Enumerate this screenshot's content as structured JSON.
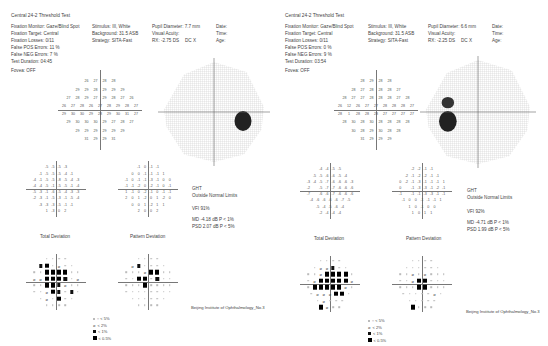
{
  "reports": [
    {
      "title": "Central 24-2 Threshold Test",
      "fixation_monitor": "Fixation Monitor: Gaze/Blind Spot",
      "fixation_target": "Fixation Target: Central",
      "fixation_losses": "Fixation Losses: 0/11",
      "false_pos": "False POS Errors:  11 %",
      "false_neg": "False NEG Errors:  7 %",
      "test_duration": "Test Duration: 04:45",
      "fovea": "Fovea: OFF",
      "stimulus": "Stimulus: III, White",
      "background": "Background: 31.5 ASB",
      "strategy": "Strategy: SITA-Fast",
      "pupil": "Pupil Diameter: 7.7 mm",
      "visual_acuity": "Visual Acuity:",
      "rx": "RX: -2.75 DS",
      "dc": "DC X",
      "date": "Date:",
      "time": "Time:",
      "age": "Age:",
      "ght_label": "GHT",
      "ght_value": "Outside Normal Limits",
      "vfi": "VFI   91%",
      "md": "MD    -4.18 dB  P < 1%",
      "psd": "PSD   2.07 dB  P < 5%",
      "total_deviation_label": "Total Deviation",
      "pattern_deviation_label": "Pattern Deviation",
      "institution": "Beijing Institute of Ophthalmology_No.3",
      "axis_label": "30",
      "threshold_rows": [
        [
          "26",
          "27",
          "28",
          "28"
        ],
        [
          "29",
          "29",
          "28",
          "29",
          "29",
          "29"
        ],
        [
          "27",
          "28",
          "29",
          "27",
          "29",
          "28",
          "27",
          "26"
        ],
        [
          "26",
          "27",
          "28",
          "26",
          "27",
          "28",
          "29",
          "28",
          "27"
        ],
        [
          "29",
          "30",
          "30",
          "29",
          "28",
          "29",
          "30",
          "31",
          "27"
        ],
        [
          "29",
          "30",
          "30",
          "30",
          "29",
          "27",
          "28",
          "27"
        ],
        [
          "29",
          "29",
          "29",
          "29",
          "29",
          "29"
        ],
        [
          "31",
          "29",
          "29",
          "31"
        ]
      ],
      "total_dev_rows": [
        [
          "-5",
          "-5",
          "-5",
          "-3"
        ],
        [
          "-1",
          "-5",
          "-5",
          "-5",
          "-4",
          "-1"
        ],
        [
          "-4",
          "-1",
          "-5",
          "-5",
          "-8",
          "-5",
          "-4",
          "-3"
        ],
        [
          "-4",
          "-4",
          "-5",
          "-1",
          "-5",
          "-5",
          "-1",
          "-4"
        ],
        [
          "-5",
          "-3",
          "-1",
          "-6",
          "-5",
          "-4",
          "-3",
          "-3"
        ],
        [
          "-2",
          "-3",
          "-1",
          "-5",
          "-3",
          "-1",
          "-5",
          "-4"
        ],
        [
          "-3",
          "-3",
          "-3",
          "-5",
          "-1",
          "-1"
        ],
        [
          "1",
          "-3",
          "0",
          "2"
        ]
      ],
      "pattern_dev_rows": [
        [
          "-1",
          "0",
          "-1",
          "-1"
        ],
        [
          "0",
          "0",
          "-1",
          "-1",
          "-1",
          "1"
        ],
        [
          "-1",
          "0",
          "-1",
          "-1",
          "-3",
          "-1",
          "0",
          "0"
        ],
        [
          "-1",
          "-1",
          "-2",
          "0",
          "-2",
          "-1",
          "0",
          "-1"
        ],
        [
          "1",
          "-1",
          "0",
          "-2",
          "-1",
          "0",
          "-1",
          "-1"
        ],
        [
          "2",
          "0",
          "1",
          "-2",
          "0",
          "1",
          "-2",
          "0"
        ],
        [
          "0",
          "0",
          "1",
          "-2",
          "1",
          "1"
        ],
        [
          "2",
          "0",
          "0",
          "2"
        ]
      ],
      "total_prob_rows": [
        [
          ".",
          ".",
          ".",
          "."
        ],
        [
          "s1",
          "s05",
          ".",
          "s2",
          ".",
          "."
        ],
        [
          ".",
          ".",
          "s05",
          "s05",
          "s05",
          "s05",
          ".",
          "."
        ],
        [
          "s2",
          "s2",
          "s05",
          "s05",
          "s05",
          "s1",
          ".",
          "s2"
        ],
        [
          ".",
          ".",
          "s05",
          "s05",
          "s1",
          "s2",
          ".",
          "."
        ],
        [
          ".",
          ".",
          "s2",
          "s05",
          "s1",
          ".",
          "s1",
          "."
        ],
        [
          ".",
          "s2",
          ".",
          "s05",
          ".",
          "."
        ],
        [
          ".",
          ".",
          ".",
          "."
        ]
      ],
      "pattern_prob_rows": [
        [
          ".",
          ".",
          ".",
          "."
        ],
        [
          "s2",
          "s1",
          ".",
          ".",
          ".",
          "."
        ],
        [
          ".",
          ".",
          ".",
          "s2",
          "s05",
          "s05",
          ".",
          "."
        ],
        [
          ".",
          ".",
          "s05",
          "s05",
          ".",
          "s1",
          ".",
          "."
        ],
        [
          ".",
          ".",
          ".",
          "s05",
          ".",
          ".",
          ".",
          "."
        ],
        [
          ".",
          ".",
          ".",
          ".",
          ".",
          ".",
          ".",
          "."
        ],
        [
          ".",
          ".",
          ".",
          ".",
          ".",
          "."
        ],
        [
          ".",
          ".",
          ".",
          "."
        ]
      ],
      "scotoma_side": "right"
    },
    {
      "title": "Central 24-2 Threshold Test",
      "fixation_monitor": "Fixation Monitor: Gaze/Blind Spot",
      "fixation_target": "Fixation Target: Central",
      "fixation_losses": "Fixation Losses: 0/11",
      "false_pos": "False POS Errors:  0 %",
      "false_neg": "False NEG Errors:  9 %",
      "test_duration": "Test Duration: 03:54",
      "fovea": "Fovea: OFF",
      "stimulus": "Stimulus: III, White",
      "background": "Background: 31.5 ASB",
      "strategy": "Strategy: SITA-Fast",
      "pupil": "Pupil Diameter: 6.6 mm",
      "visual_acuity": "Visual Acuity:",
      "rx": "RX: -2.25 DS",
      "dc": "DC X",
      "date": "Date:",
      "time": "Time:",
      "age": "Age:",
      "ght_label": "GHT",
      "ght_value": "Outside Normal Limits",
      "vfi": "VFI   92%",
      "md": "MD    -4.71 dB  P < 1%",
      "psd": "PSD   1.99 dB  P < 5%",
      "total_deviation_label": "Total Deviation",
      "pattern_deviation_label": "Pattern Deviation",
      "institution": "Beijing Institute of Ophthalmology_No.3",
      "axis_label": "30",
      "threshold_rows": [
        [
          "28",
          "29",
          "28",
          "28"
        ],
        [
          "28",
          "27",
          "28",
          "28",
          "28",
          "27"
        ],
        [
          "28",
          "27",
          "27",
          "28",
          "28",
          "28",
          "27",
          "28"
        ],
        [
          "26",
          "12",
          "26",
          "27",
          "27",
          "28",
          "28",
          "28",
          "27"
        ],
        [
          "28",
          "1",
          "28",
          "28",
          "28",
          "27",
          "27",
          "27",
          "27"
        ],
        [
          "28",
          "30",
          "28",
          "30",
          "28",
          "28",
          "28",
          "28"
        ],
        [
          "30",
          "28",
          "29",
          "30",
          "28",
          "28"
        ],
        [
          "31",
          "29",
          "29",
          "29"
        ]
      ],
      "total_dev_rows": [
        [
          "-4",
          "-4",
          "-5",
          "-5"
        ],
        [
          "-5",
          "-5",
          "-6",
          "-6",
          "-5",
          "-4"
        ],
        [
          "-3",
          "-4",
          "-5",
          "-7",
          "-6",
          "-6",
          "-6",
          "-3"
        ],
        [
          "-2",
          "",
          "-5",
          "-7",
          "-7",
          "-6",
          "-6",
          "-6"
        ],
        [
          "-7",
          "",
          "-6",
          "-6",
          "-7",
          "-6",
          "-6",
          "-6"
        ],
        [
          "-4",
          "-6",
          "-6",
          "-6",
          "-6",
          "-7",
          "-5"
        ],
        [
          "-5",
          "-4",
          "-5",
          "-6",
          "-4"
        ],
        [
          "-2",
          "-4",
          "-4",
          "-4"
        ]
      ],
      "pattern_dev_rows": [
        [
          "-2",
          "-2",
          "-1",
          "-1"
        ],
        [
          "-2",
          "-1",
          "-2",
          "-2",
          "-1",
          "-1"
        ],
        [
          "0",
          "-2",
          "-1",
          "-3",
          "-1",
          "-1",
          "-1",
          "1"
        ],
        [
          "0",
          "",
          "-1",
          "-3",
          "-3",
          "-1",
          "-2",
          "-1"
        ],
        [
          "-1",
          "",
          "-1",
          "-1",
          "-3",
          "-3",
          "-1",
          "-1"
        ],
        [
          "-1",
          "0",
          "0",
          "-1",
          "-1",
          "-1",
          "1"
        ],
        [
          "1",
          "0",
          "-1",
          "0",
          "0"
        ],
        [
          "1",
          "0",
          "1",
          "1"
        ]
      ],
      "total_prob_rows": [
        [
          ".",
          ".",
          ".",
          "."
        ],
        [
          ".",
          "s2",
          "s2",
          "s1",
          ".",
          "."
        ],
        [
          ".",
          ".",
          "s2",
          "s05",
          "s05",
          "s05",
          "s05",
          "."
        ],
        [
          ".",
          "s2",
          "s05",
          "s05",
          "s05",
          "s05",
          "s05",
          "s2"
        ],
        [
          ".",
          "s05",
          "s05",
          "s05",
          "s05",
          "s05",
          "s2",
          "."
        ],
        [
          ".",
          "s2",
          "s2",
          "s2",
          "s05",
          "s05",
          "."
        ],
        [
          ".",
          "s2",
          ".",
          ".",
          "."
        ],
        [
          "s05",
          "s2",
          ".",
          "."
        ]
      ],
      "pattern_prob_rows": [
        [
          ".",
          ".",
          ".",
          "."
        ],
        [
          ".",
          ".",
          ".",
          ".",
          ".",
          "."
        ],
        [
          ".",
          ".",
          "s2",
          ".",
          "s2",
          ".",
          ".",
          "."
        ],
        [
          ".",
          ".",
          "s2",
          "s05",
          "s05",
          ".",
          ".",
          "."
        ],
        [
          ".",
          ".",
          ".",
          "s05",
          "s05",
          ".",
          ".",
          "."
        ],
        [
          ".",
          ".",
          ".",
          ".",
          ".",
          "s2",
          "."
        ],
        [
          ".",
          ".",
          ".",
          ".",
          "."
        ],
        [
          "s05",
          ".",
          ".",
          "."
        ]
      ],
      "scotoma_side": "left"
    }
  ],
  "legend": {
    "items": [
      {
        "symbol": "dot",
        "label": ":: < 5%"
      },
      {
        "symbol": "s2",
        "label": "< 2%"
      },
      {
        "symbol": "s1",
        "label": "< 1%"
      },
      {
        "symbol": "s05",
        "label": "< 0.5%"
      }
    ]
  }
}
